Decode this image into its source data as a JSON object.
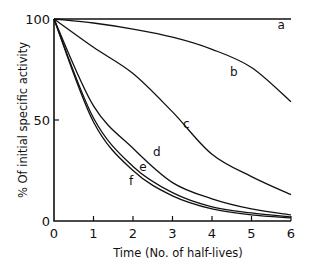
{
  "chart_data": {
    "type": "line",
    "title": "",
    "xlabel": "Time (No. of half-lives)",
    "ylabel": "% Of initial specific activity",
    "xlim": [
      0,
      6
    ],
    "ylim": [
      0,
      100
    ],
    "x_ticks": [
      "0",
      "1",
      "2",
      "3",
      "4",
      "5",
      "6"
    ],
    "y_ticks": [
      "0",
      "50",
      "100"
    ],
    "grid": false,
    "legend": "inline curve labels",
    "x": [
      0,
      1,
      2,
      3,
      4,
      5,
      6
    ],
    "series": [
      {
        "name": "a",
        "values": [
          100,
          100,
          100,
          100,
          100,
          100,
          100
        ]
      },
      {
        "name": "b",
        "values": [
          100,
          98,
          95,
          91,
          85,
          76,
          59
        ]
      },
      {
        "name": "c",
        "values": [
          100,
          86,
          73,
          54,
          33,
          22,
          13
        ]
      },
      {
        "name": "d",
        "values": [
          100,
          57,
          36,
          19,
          11,
          6,
          3
        ]
      },
      {
        "name": "e",
        "values": [
          100,
          51,
          27,
          14,
          7,
          4,
          2
        ]
      },
      {
        "name": "f",
        "values": [
          100,
          49,
          25,
          12.5,
          6,
          3,
          1.6
        ]
      }
    ],
    "labels": {
      "a": {
        "x": 5.75,
        "y": 95
      },
      "b": {
        "x": 4.55,
        "y": 72
      },
      "c": {
        "x": 3.35,
        "y": 46
      },
      "d": {
        "x": 2.6,
        "y": 32
      },
      "e": {
        "x": 2.25,
        "y": 25
      },
      "f": {
        "x": 1.95,
        "y": 18
      }
    }
  }
}
